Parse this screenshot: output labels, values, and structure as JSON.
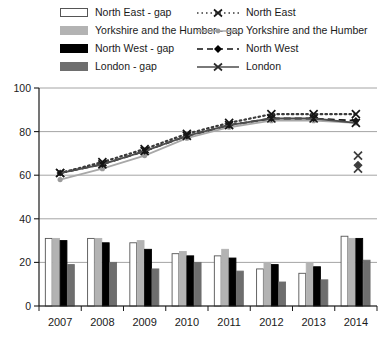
{
  "legend": {
    "left_column": [
      {
        "label": "North East - gap",
        "swatch": "hollow-bar-icon"
      },
      {
        "label": "Yorkshire and the Humber - gap",
        "swatch": "light-grey-bar-icon"
      },
      {
        "label": "North West - gap",
        "swatch": "black-bar-icon"
      },
      {
        "label": "London - gap",
        "swatch": "dark-grey-bar-icon"
      }
    ],
    "right_column": [
      {
        "label": "North East",
        "swatch": "dotted-line-x-marker-icon"
      },
      {
        "label": "Yorkshire and the Humber",
        "swatch": "grey-line-circle-marker-icon"
      },
      {
        "label": "North West",
        "swatch": "dashed-line-diamond-marker-icon"
      },
      {
        "label": "London",
        "swatch": "solid-line-x-marker-icon"
      }
    ]
  },
  "chart_data": {
    "type": "bar",
    "title": "",
    "xlabel": "",
    "ylabel": "",
    "ylim": [
      0,
      100
    ],
    "yticks": [
      0,
      20,
      40,
      60,
      80,
      100
    ],
    "grid": true,
    "legend_position": "top",
    "categories": [
      "2007",
      "2008",
      "2009",
      "2010",
      "2011",
      "2012",
      "2013",
      "2014"
    ],
    "bar_series": [
      {
        "name": "North East - gap",
        "color": "#ffffff",
        "edge": "#555555",
        "values": [
          31,
          31,
          29,
          24,
          23,
          17,
          15,
          32
        ]
      },
      {
        "name": "Yorkshire and the Humber - gap",
        "color": "#b3b3b3",
        "edge": "#b3b3b3",
        "values": [
          31,
          31,
          30,
          25,
          26,
          20,
          20,
          31
        ]
      },
      {
        "name": "North West - gap",
        "color": "#000000",
        "edge": "#000000",
        "values": [
          30,
          29,
          26,
          23,
          22,
          19,
          18,
          31
        ]
      },
      {
        "name": "London - gap",
        "color": "#6e6e6e",
        "edge": "#6e6e6e",
        "values": [
          19,
          20,
          17,
          20,
          16,
          11,
          12,
          21
        ]
      }
    ],
    "line_series": [
      {
        "name": "North East",
        "color": "#3a3a3a",
        "style": "dotted",
        "marker": "x",
        "values": [
          61,
          66,
          72,
          79,
          84,
          88,
          88,
          88
        ]
      },
      {
        "name": "Yorkshire and the Humber",
        "color": "#a8a8a8",
        "style": "solid",
        "marker": "circle",
        "values": [
          58,
          63,
          69,
          77,
          82,
          85,
          85,
          84
        ]
      },
      {
        "name": "North West",
        "color": "#111111",
        "style": "dashed",
        "marker": "diamond",
        "values": [
          61,
          65,
          71,
          78,
          83,
          86,
          86,
          85
        ]
      },
      {
        "name": "London",
        "color": "#4d4d4d",
        "style": "solid",
        "marker": "x",
        "values": [
          61,
          65,
          71,
          78,
          83,
          86,
          86,
          84
        ]
      }
    ],
    "stray_markers": [
      {
        "name": "North East",
        "marker": "x",
        "value": 69
      },
      {
        "name": "North West",
        "marker": "diamond",
        "value": 65
      },
      {
        "name": "London",
        "marker": "x",
        "value": 63
      }
    ]
  }
}
